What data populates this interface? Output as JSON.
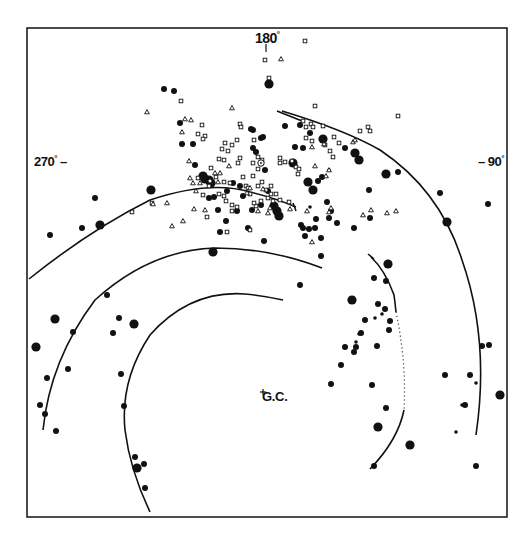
{
  "figure": {
    "type": "galactic spiral structure map",
    "frame": {
      "x1": 27,
      "y1": 28,
      "x2": 507,
      "y2": 517
    },
    "ink_color": "#111111",
    "background": "#ffffff"
  },
  "labels": {
    "top": "180",
    "left": "270",
    "right": "90",
    "center": "G.C.",
    "degree_mark": "°",
    "dash": "–"
  },
  "center_marker": {
    "name": "galactic-center",
    "x": 263,
    "y": 392
  },
  "sun_marker": {
    "x": 261,
    "y": 163
  },
  "arms": [
    {
      "name": "outer-arm-right",
      "style": "solid",
      "d": "M 282 111 Q 345 130 380 150 Q 440 190 462 260 Q 490 340 476 435"
    },
    {
      "name": "local-arm",
      "style": "solid",
      "d": "M 29 279 Q 90 230 150 200 Q 210 180 250 192 Q 275 198 296 207"
    },
    {
      "name": "local-arm-tick",
      "style": "solid",
      "d": "M 293 203 L 296 211"
    },
    {
      "name": "sagittarius-arm",
      "style": "solid",
      "d": "M 43 430 Q 50 360 95 300 Q 150 250 215 248 Q 270 248 322 268"
    },
    {
      "name": "inner-arm",
      "style": "solid",
      "d": "M 150 512 Q 130 470 125 430 Q 120 380 150 335 Q 190 290 245 294 Q 265 296 283 300"
    },
    {
      "name": "right-arm-upper",
      "style": "solid",
      "d": "M 371 257 Q 385 270 394 295 Q 395 302 396 312"
    },
    {
      "name": "right-arm-dotted",
      "style": "dotted",
      "d": "M 396 312 Q 402 340 404 370 Q 405 390 404 410"
    },
    {
      "name": "right-arm-lower",
      "style": "solid",
      "d": "M 404 410 Q 398 440 370 469"
    },
    {
      "name": "right-arm-tick",
      "style": "solid",
      "d": "M 368 254 L 374 259"
    },
    {
      "name": "upper-right-arm-stub",
      "style": "solid",
      "d": "M 277 111 L 302 121"
    }
  ],
  "symbols": {
    "large_dots": [
      [
        269,
        84
      ],
      [
        151,
        190
      ],
      [
        100,
        225
      ],
      [
        213,
        252
      ],
      [
        134,
        324
      ],
      [
        36,
        347
      ],
      [
        55,
        319
      ],
      [
        137,
        468
      ],
      [
        352,
        300
      ],
      [
        388,
        264
      ],
      [
        378,
        427
      ],
      [
        410,
        445
      ],
      [
        500,
        395
      ],
      [
        447,
        222
      ],
      [
        386,
        174
      ],
      [
        359,
        160
      ],
      [
        205,
        179
      ],
      [
        209,
        180
      ],
      [
        203,
        176
      ],
      [
        211,
        183
      ],
      [
        277,
        211
      ],
      [
        274,
        206
      ],
      [
        279,
        216
      ],
      [
        293,
        163
      ],
      [
        308,
        182
      ],
      [
        313,
        190
      ],
      [
        355,
        153
      ],
      [
        323,
        139
      ]
    ],
    "medium_dots": [
      [
        164,
        89
      ],
      [
        174,
        91
      ],
      [
        95,
        198
      ],
      [
        50,
        235
      ],
      [
        82,
        228
      ],
      [
        214,
        197
      ],
      [
        227,
        191
      ],
      [
        237,
        211
      ],
      [
        243,
        196
      ],
      [
        182,
        144
      ],
      [
        193,
        144
      ],
      [
        195,
        165
      ],
      [
        253,
        130
      ],
      [
        253,
        148
      ],
      [
        256,
        152
      ],
      [
        265,
        170
      ],
      [
        261,
        138
      ],
      [
        295,
        147
      ],
      [
        300,
        125
      ],
      [
        310,
        133
      ],
      [
        318,
        181
      ],
      [
        322,
        177
      ],
      [
        327,
        202
      ],
      [
        331,
        211
      ],
      [
        329,
        218
      ],
      [
        345,
        148
      ],
      [
        369,
        190
      ],
      [
        398,
        172
      ],
      [
        440,
        193
      ],
      [
        488,
        204
      ],
      [
        482,
        346
      ],
      [
        489,
        345
      ],
      [
        470,
        375
      ],
      [
        465,
        405
      ],
      [
        476,
        466
      ],
      [
        107,
        295
      ],
      [
        119,
        318
      ],
      [
        73,
        332
      ],
      [
        68,
        369
      ],
      [
        47,
        378
      ],
      [
        45,
        414
      ],
      [
        40,
        405
      ],
      [
        56,
        431
      ],
      [
        113,
        333
      ],
      [
        121,
        374
      ],
      [
        124,
        406
      ],
      [
        135,
        457
      ],
      [
        145,
        488
      ],
      [
        144,
        464
      ],
      [
        331,
        384
      ],
      [
        341,
        365
      ],
      [
        345,
        347
      ],
      [
        372,
        385
      ],
      [
        390,
        321
      ],
      [
        385,
        309
      ],
      [
        378,
        304
      ],
      [
        374,
        278
      ],
      [
        354,
        352
      ],
      [
        356,
        347
      ],
      [
        365,
        320
      ],
      [
        361,
        333
      ],
      [
        389,
        330
      ],
      [
        377,
        346
      ],
      [
        374,
        466
      ],
      [
        386,
        408
      ],
      [
        445,
        375
      ],
      [
        248,
        228
      ],
      [
        303,
        228
      ],
      [
        301,
        225
      ],
      [
        309,
        229
      ],
      [
        315,
        228
      ],
      [
        305,
        236
      ],
      [
        321,
        238
      ],
      [
        264,
        241
      ],
      [
        300,
        285
      ],
      [
        386,
        281
      ],
      [
        321,
        256
      ],
      [
        263,
        137
      ],
      [
        252,
        210
      ],
      [
        316,
        219
      ],
      [
        337,
        223
      ],
      [
        354,
        228
      ],
      [
        370,
        218
      ],
      [
        285,
        126
      ],
      [
        303,
        148
      ],
      [
        209,
        198
      ],
      [
        218,
        210
      ],
      [
        226,
        221
      ],
      [
        220,
        232
      ],
      [
        261,
        205
      ],
      [
        268,
        191
      ],
      [
        233,
        183
      ],
      [
        240,
        186
      ],
      [
        180,
        123
      ],
      [
        251,
        129
      ]
    ],
    "small_dots": [
      [
        356,
        342
      ],
      [
        375,
        318
      ],
      [
        476,
        383
      ],
      [
        462,
        405
      ],
      [
        456,
        432
      ],
      [
        359,
        334
      ],
      [
        382,
        314
      ],
      [
        310,
        207
      ],
      [
        329,
        170
      ]
    ],
    "squares": [
      [
        305,
        41
      ],
      [
        265,
        60
      ],
      [
        269,
        78
      ],
      [
        181,
        101
      ],
      [
        315,
        106
      ],
      [
        398,
        116
      ],
      [
        368,
        127
      ],
      [
        202,
        125
      ],
      [
        240,
        124
      ],
      [
        241,
        127
      ],
      [
        198,
        134
      ],
      [
        205,
        136
      ],
      [
        203,
        139
      ],
      [
        237,
        140
      ],
      [
        254,
        140
      ],
      [
        225,
        143
      ],
      [
        232,
        145
      ],
      [
        222,
        149
      ],
      [
        228,
        151
      ],
      [
        258,
        157
      ],
      [
        253,
        163
      ],
      [
        258,
        169
      ],
      [
        262,
        160
      ],
      [
        219,
        159
      ],
      [
        224,
        160
      ],
      [
        240,
        158
      ],
      [
        238,
        163
      ],
      [
        280,
        163
      ],
      [
        292,
        161
      ],
      [
        296,
        167
      ],
      [
        299,
        169
      ],
      [
        298,
        174
      ],
      [
        280,
        158
      ],
      [
        285,
        162
      ],
      [
        211,
        168
      ],
      [
        198,
        178
      ],
      [
        210,
        181
      ],
      [
        216,
        177
      ],
      [
        209,
        186
      ],
      [
        224,
        182
      ],
      [
        230,
        183
      ],
      [
        243,
        177
      ],
      [
        246,
        186
      ],
      [
        253,
        176
      ],
      [
        248,
        188
      ],
      [
        258,
        186
      ],
      [
        262,
        182
      ],
      [
        266,
        190
      ],
      [
        271,
        186
      ],
      [
        226,
        201
      ],
      [
        232,
        205
      ],
      [
        250,
        194
      ],
      [
        256,
        206
      ],
      [
        268,
        198
      ],
      [
        271,
        194
      ],
      [
        273,
        201
      ],
      [
        276,
        194
      ],
      [
        280,
        200
      ],
      [
        289,
        202
      ],
      [
        232,
        211
      ],
      [
        227,
        232
      ],
      [
        303,
        121
      ],
      [
        306,
        127
      ],
      [
        311,
        124
      ],
      [
        313,
        127
      ],
      [
        323,
        126
      ],
      [
        334,
        137
      ],
      [
        339,
        143
      ],
      [
        360,
        131
      ],
      [
        370,
        131
      ],
      [
        306,
        138
      ],
      [
        312,
        141
      ],
      [
        330,
        151
      ],
      [
        333,
        157
      ],
      [
        325,
        145
      ],
      [
        152,
        203
      ],
      [
        132,
        212
      ],
      [
        207,
        217
      ],
      [
        237,
        207
      ],
      [
        203,
        195
      ],
      [
        219,
        194
      ],
      [
        224,
        196
      ],
      [
        250,
        230
      ],
      [
        254,
        203
      ],
      [
        261,
        201
      ]
    ],
    "triangles": [
      [
        281,
        59
      ],
      [
        147,
        112
      ],
      [
        232,
        108
      ],
      [
        191,
        120
      ],
      [
        182,
        132
      ],
      [
        189,
        161
      ],
      [
        185,
        119
      ],
      [
        329,
        170
      ],
      [
        324,
        144
      ],
      [
        353,
        142
      ],
      [
        355,
        140
      ],
      [
        312,
        147
      ],
      [
        315,
        166
      ],
      [
        326,
        176
      ],
      [
        167,
        203
      ],
      [
        190,
        178
      ],
      [
        193,
        183
      ],
      [
        200,
        183
      ],
      [
        196,
        191
      ],
      [
        205,
        210
      ],
      [
        183,
        221
      ],
      [
        172,
        226
      ],
      [
        153,
        204
      ],
      [
        263,
        189
      ],
      [
        307,
        211
      ],
      [
        329,
        212
      ],
      [
        331,
        208
      ],
      [
        312,
        242
      ],
      [
        363,
        215
      ],
      [
        371,
        210
      ],
      [
        387,
        213
      ],
      [
        396,
        211
      ],
      [
        194,
        209
      ],
      [
        218,
        182
      ],
      [
        229,
        166
      ],
      [
        250,
        188
      ],
      [
        247,
        193
      ],
      [
        258,
        211
      ],
      [
        268,
        213
      ],
      [
        290,
        209
      ],
      [
        270,
        208
      ],
      [
        215,
        173
      ],
      [
        220,
        173
      ]
    ]
  }
}
